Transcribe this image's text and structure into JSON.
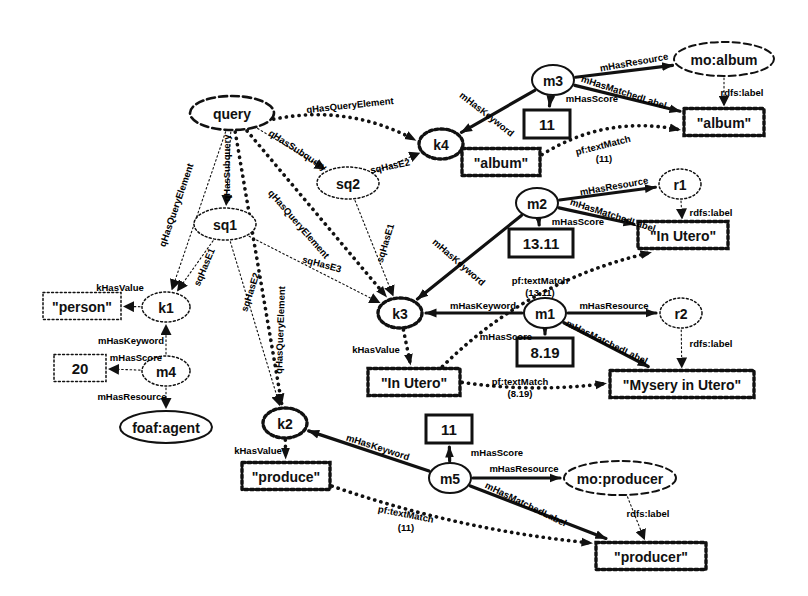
{
  "diagram": {
    "colors": {
      "stroke": "#111111",
      "fill": "#ffffff",
      "text": "#111111"
    },
    "nodes": [
      {
        "id": "query",
        "label": "query",
        "shape": "ellipse-dashed-bold",
        "x": 232,
        "y": 113,
        "rx": 42,
        "ry": 17
      },
      {
        "id": "sq1",
        "label": "sq1",
        "shape": "ellipse-dotted",
        "x": 225,
        "y": 224,
        "rx": 31,
        "ry": 16
      },
      {
        "id": "sq2",
        "label": "sq2",
        "shape": "ellipse-dotted",
        "x": 348,
        "y": 183,
        "rx": 31,
        "ry": 16
      },
      {
        "id": "k1",
        "label": "k1",
        "shape": "ellipse-dotted",
        "x": 166,
        "y": 307,
        "rx": 24,
        "ry": 15
      },
      {
        "id": "k2",
        "label": "k2",
        "shape": "ellipse-dotted-bold",
        "x": 285,
        "y": 423,
        "rx": 22,
        "ry": 15
      },
      {
        "id": "k3",
        "label": "k3",
        "shape": "ellipse-dotted-bold",
        "x": 400,
        "y": 313,
        "rx": 22,
        "ry": 15
      },
      {
        "id": "k4",
        "label": "k4",
        "shape": "ellipse-dotted-bold",
        "x": 441,
        "y": 144,
        "rx": 22,
        "ry": 15
      },
      {
        "id": "m1",
        "label": "m1",
        "shape": "ellipse-solid",
        "x": 545,
        "y": 313,
        "rx": 21,
        "ry": 15
      },
      {
        "id": "m2",
        "label": "m2",
        "shape": "ellipse-solid",
        "x": 537,
        "y": 203,
        "rx": 21,
        "ry": 15
      },
      {
        "id": "m3",
        "label": "m3",
        "shape": "ellipse-solid",
        "x": 553,
        "y": 80,
        "rx": 21,
        "ry": 15
      },
      {
        "id": "m4",
        "label": "m4",
        "shape": "ellipse-dotted",
        "x": 166,
        "y": 371,
        "rx": 24,
        "ry": 15
      },
      {
        "id": "m5",
        "label": "m5",
        "shape": "ellipse-solid",
        "x": 450,
        "y": 478,
        "rx": 21,
        "ry": 15
      },
      {
        "id": "r1",
        "label": "r1",
        "shape": "ellipse-dotted",
        "x": 680,
        "y": 184,
        "rx": 21,
        "ry": 15
      },
      {
        "id": "r2",
        "label": "r2",
        "shape": "ellipse-dotted",
        "x": 681,
        "y": 313,
        "rx": 21,
        "ry": 15
      },
      {
        "id": "mo_album",
        "label": "mo:album",
        "shape": "ellipse-dashed",
        "x": 724,
        "y": 59,
        "rx": 50,
        "ry": 17
      },
      {
        "id": "mo_producer",
        "label": "mo:producer",
        "shape": "ellipse-dashed",
        "x": 620,
        "y": 478,
        "rx": 56,
        "ry": 17
      },
      {
        "id": "foaf_agent",
        "label": "foaf:agent",
        "shape": "ellipse-solid",
        "x": 166,
        "y": 427,
        "rx": 46,
        "ry": 16
      },
      {
        "id": "b_person",
        "label": "\"person\"",
        "shape": "rect-dotted",
        "x": 82,
        "y": 306,
        "w": 78,
        "h": 27
      },
      {
        "id": "b_20",
        "label": "20",
        "shape": "rect-dotted",
        "x": 80,
        "y": 368,
        "w": 52,
        "h": 27
      },
      {
        "id": "b_produce",
        "label": "\"produce\"",
        "shape": "rect-dotted-bold",
        "x": 286,
        "y": 476,
        "w": 88,
        "h": 27
      },
      {
        "id": "b_inutero_k",
        "label": "\"In Utero\"",
        "shape": "rect-dotted-bold",
        "x": 414,
        "y": 382,
        "w": 92,
        "h": 27
      },
      {
        "id": "b_album_k",
        "label": "\"album\"",
        "shape": "rect-dotted-bold",
        "x": 501,
        "y": 162,
        "w": 78,
        "h": 27
      },
      {
        "id": "b_album_r",
        "label": "\"album\"",
        "shape": "rect-dotted-bold",
        "x": 724,
        "y": 122,
        "w": 80,
        "h": 27
      },
      {
        "id": "b_inutero_r",
        "label": "\"In Utero\"",
        "shape": "rect-dotted-bold",
        "x": 683,
        "y": 235,
        "w": 90,
        "h": 27
      },
      {
        "id": "b_mysery",
        "label": "\"Mysery in Utero\"",
        "shape": "rect-dotted-bold",
        "x": 682,
        "y": 384,
        "w": 144,
        "h": 27
      },
      {
        "id": "b_producer",
        "label": "\"producer\"",
        "shape": "rect-dotted-bold",
        "x": 651,
        "y": 556,
        "w": 110,
        "h": 27
      },
      {
        "id": "n_11_m3",
        "label": "11",
        "shape": "rect-solid-bold",
        "x": 547,
        "y": 124,
        "w": 46,
        "h": 28
      },
      {
        "id": "n_1311_m2",
        "label": "13.11",
        "shape": "rect-solid-bold",
        "x": 541,
        "y": 243,
        "w": 64,
        "h": 28
      },
      {
        "id": "n_819_m1",
        "label": "8.19",
        "shape": "rect-solid-bold",
        "x": 545,
        "y": 352,
        "w": 56,
        "h": 28
      },
      {
        "id": "n_11_m5",
        "label": "11",
        "shape": "rect-solid-bold",
        "x": 449,
        "y": 429,
        "w": 46,
        "h": 28
      }
    ],
    "edges": [
      {
        "from": "query",
        "to": "k4",
        "label": "qHasQueryElement",
        "style": "dotted-bold"
      },
      {
        "from": "query",
        "to": "k1",
        "label": "qHasQueryElement",
        "style": "dotted-thin"
      },
      {
        "from": "query",
        "to": "sq1",
        "label": "qHasSubquery",
        "style": "dotted-thin"
      },
      {
        "from": "query",
        "to": "k3",
        "label": "qHasQueryElement",
        "style": "dotted-bold"
      },
      {
        "from": "query",
        "to": "k2",
        "label": "qHasQueryElement",
        "style": "dotted-bold"
      },
      {
        "from": "query",
        "to": "sq2",
        "label": "qHasSubquery",
        "style": "dotted-thin"
      },
      {
        "from": "sq2",
        "to": "k4",
        "label": "sqHasE2",
        "style": "dotted-thin"
      },
      {
        "from": "sq2",
        "to": "k3",
        "label": "sqHasE1",
        "style": "dotted-thin"
      },
      {
        "from": "sq1",
        "to": "k1",
        "label": "sqHasE1",
        "style": "dotted-thin"
      },
      {
        "from": "sq1",
        "to": "k2",
        "label": "sqHasE2",
        "style": "dotted-thin"
      },
      {
        "from": "sq1",
        "to": "k3",
        "label": "sqHasE3",
        "style": "dotted-thin"
      },
      {
        "from": "k1",
        "to": "b_person",
        "label": "kHasValue",
        "style": "dotted-thin"
      },
      {
        "from": "k2",
        "to": "b_produce",
        "label": "kHasValue",
        "style": "dotted-bold"
      },
      {
        "from": "k3",
        "to": "b_inutero_k",
        "label": "kHasValue",
        "style": "dotted-bold"
      },
      {
        "from": "k4",
        "to": "b_album_k",
        "label": "kHasValue",
        "style": "dotted-bold"
      },
      {
        "from": "m4",
        "to": "k1",
        "label": "mHasKeyword",
        "style": "dotted-thin"
      },
      {
        "from": "m4",
        "to": "b_20",
        "label": "mHasScore",
        "style": "dotted-thin"
      },
      {
        "from": "m4",
        "to": "foaf_agent",
        "label": "mHasResource",
        "style": "dotted-thin"
      },
      {
        "from": "m3",
        "to": "k4",
        "label": "mHasKeyword",
        "style": "solid-bold"
      },
      {
        "from": "m3",
        "to": "n_11_m3",
        "label": "mHasScore",
        "style": "solid-bold"
      },
      {
        "from": "m3",
        "to": "mo_album",
        "label": "mHasResource",
        "style": "solid-bold"
      },
      {
        "from": "m3",
        "to": "b_album_r",
        "label": "mHasMatchedLabel",
        "style": "solid-bold"
      },
      {
        "from": "mo_album",
        "to": "b_album_r",
        "label": "rdfs:label",
        "style": "dotted-thin"
      },
      {
        "from": "b_album_k",
        "to": "b_album_r",
        "label": "pf:textMatch (11)",
        "style": "dotted-bold"
      },
      {
        "from": "m2",
        "to": "k3",
        "label": "mHasKeyword",
        "style": "solid-bold"
      },
      {
        "from": "m2",
        "to": "n_1311_m2",
        "label": "mHasScore",
        "style": "solid-bold"
      },
      {
        "from": "m2",
        "to": "r1",
        "label": "mHasResource",
        "style": "solid-bold"
      },
      {
        "from": "m2",
        "to": "b_inutero_r",
        "label": "mHasMatchedLabel",
        "style": "solid-bold"
      },
      {
        "from": "r1",
        "to": "b_inutero_r",
        "label": "rdfs:label",
        "style": "dotted-thin"
      },
      {
        "from": "b_inutero_k",
        "to": "b_inutero_r",
        "label": "pf:textMatch (13.11)",
        "style": "dotted-bold"
      },
      {
        "from": "m1",
        "to": "k3",
        "label": "mHasKeyword",
        "style": "solid-bold"
      },
      {
        "from": "m1",
        "to": "n_819_m1",
        "label": "mHasScore",
        "style": "solid-bold"
      },
      {
        "from": "m1",
        "to": "r2",
        "label": "mHasResource",
        "style": "solid-bold"
      },
      {
        "from": "m1",
        "to": "b_mysery",
        "label": "mHasMatchedLabel",
        "style": "solid-bold"
      },
      {
        "from": "r2",
        "to": "b_mysery",
        "label": "rdfs:label",
        "style": "dotted-thin"
      },
      {
        "from": "b_inutero_k",
        "to": "b_mysery",
        "label": "pf:textMatch (8.19)",
        "style": "dotted-bold"
      },
      {
        "from": "m5",
        "to": "k2",
        "label": "mHasKeyword",
        "style": "solid-bold"
      },
      {
        "from": "m5",
        "to": "n_11_m5",
        "label": "mHasScore",
        "style": "solid-bold"
      },
      {
        "from": "m5",
        "to": "mo_producer",
        "label": "mHasResource",
        "style": "solid-bold"
      },
      {
        "from": "m5",
        "to": "b_producer",
        "label": "mHasMatchedLabel",
        "style": "solid-bold"
      },
      {
        "from": "mo_producer",
        "to": "b_producer",
        "label": "rdfs:label",
        "style": "dotted-thin"
      },
      {
        "from": "b_produce",
        "to": "b_producer",
        "label": "pf:textMatch (11)",
        "style": "dotted-bold"
      }
    ],
    "edge_labels": [
      {
        "id": "el_q_k4",
        "text": "qHasQueryElement",
        "x": 350,
        "y": 105,
        "rot": -6,
        "size": 10
      },
      {
        "id": "el_q_k1",
        "text": "qHasQueryElement",
        "x": 176,
        "y": 205,
        "rot": -71,
        "size": 9
      },
      {
        "id": "el_q_sq1",
        "text": "qHasSubquery",
        "x": 226,
        "y": 168,
        "rot": -90,
        "size": 9
      },
      {
        "id": "el_q_k3",
        "text": "qHasQueryElement",
        "x": 299,
        "y": 224,
        "rot": 49,
        "size": 10
      },
      {
        "id": "el_q_k2",
        "text": "qHasQueryElement",
        "x": 280,
        "y": 330,
        "rot": -88,
        "size": 9
      },
      {
        "id": "el_q_sq2",
        "text": "qHasSubquery",
        "x": 298,
        "y": 150,
        "rot": 33,
        "size": 9.5
      },
      {
        "id": "el_sq2_k4",
        "text": "sqHasE2",
        "x": 390,
        "y": 166,
        "rot": -12,
        "size": 9
      },
      {
        "id": "el_sq2_k3",
        "text": "sqHasE1",
        "x": 385,
        "y": 243,
        "rot": -73,
        "size": 8.5
      },
      {
        "id": "el_sq1_k1",
        "text": "sqHasE1",
        "x": 204,
        "y": 267,
        "rot": -67,
        "size": 8.5
      },
      {
        "id": "el_sq1_k2",
        "text": "sqHasE2",
        "x": 250,
        "y": 292,
        "rot": -72,
        "size": 8.5
      },
      {
        "id": "el_sq1_k3",
        "text": "sqHasE3",
        "x": 322,
        "y": 264,
        "rot": 15,
        "size": 9
      },
      {
        "id": "el_k1_v",
        "text": "kHasValue",
        "x": 120,
        "y": 287,
        "rot": 0,
        "size": 9.5
      },
      {
        "id": "el_k2_v",
        "text": "kHasValue",
        "x": 258,
        "y": 450,
        "rot": 0,
        "size": 9.5
      },
      {
        "id": "el_k3_v",
        "text": "kHasValue",
        "x": 376,
        "y": 349,
        "rot": 0,
        "size": 9.5
      },
      {
        "id": "el_m4_k1",
        "text": "mHasKeyword",
        "x": 131,
        "y": 340,
        "rot": 0,
        "size": 9.5
      },
      {
        "id": "el_m4_s",
        "text": "mHasScore",
        "x": 136,
        "y": 357,
        "rot": 0,
        "size": 9.5
      },
      {
        "id": "el_m4_r",
        "text": "mHasResource",
        "x": 132,
        "y": 396,
        "rot": 0,
        "size": 9.5
      },
      {
        "id": "el_m3_k",
        "text": "mHasKeyword",
        "x": 487,
        "y": 114,
        "rot": 38,
        "size": 9.5
      },
      {
        "id": "el_m3_s",
        "text": "mHasScore",
        "x": 592,
        "y": 98,
        "rot": 0,
        "size": 9.5
      },
      {
        "id": "el_m3_r",
        "text": "mHasResource",
        "x": 634,
        "y": 62,
        "rot": -10,
        "size": 9.5
      },
      {
        "id": "el_m3_ml",
        "text": "mHasMatchedLabel",
        "x": 624,
        "y": 92,
        "rot": 18,
        "size": 9.5
      },
      {
        "id": "el_rdfs1",
        "text": "rdfs:label",
        "x": 742,
        "y": 92,
        "rot": 0,
        "size": 9.5
      },
      {
        "id": "el_pf1",
        "text": "pf:textMatch",
        "x": 603,
        "y": 145,
        "rot": -14,
        "size": 9
      },
      {
        "id": "el_pf1b",
        "text": "(11)",
        "x": 604,
        "y": 158,
        "rot": 0,
        "size": 9
      },
      {
        "id": "el_m2_k",
        "text": "mHasKeyword",
        "x": 459,
        "y": 262,
        "rot": 41,
        "size": 9.5
      },
      {
        "id": "el_m2_s",
        "text": "mHasScore",
        "x": 578,
        "y": 221,
        "rot": 0,
        "size": 9.5
      },
      {
        "id": "el_m2_r",
        "text": "mHasResource",
        "x": 614,
        "y": 186,
        "rot": -10,
        "size": 9.5
      },
      {
        "id": "el_m2_ml",
        "text": "mHasMatchedLabel",
        "x": 613,
        "y": 215,
        "rot": 18,
        "size": 9.5
      },
      {
        "id": "el_rdfs2",
        "text": "rdfs:label",
        "x": 711,
        "y": 212,
        "rot": 0,
        "size": 9.5
      },
      {
        "id": "el_pf2",
        "text": "pf:textMatch",
        "x": 540,
        "y": 280,
        "rot": 0,
        "size": 9
      },
      {
        "id": "el_pf2b",
        "text": "(13.11)",
        "x": 540,
        "y": 292,
        "rot": 0,
        "size": 9
      },
      {
        "id": "el_m1_k",
        "text": "mHasKeyword",
        "x": 483,
        "y": 305,
        "rot": 0,
        "size": 9.5
      },
      {
        "id": "el_m1_s",
        "text": "mHasScore",
        "x": 506,
        "y": 336,
        "rot": 0,
        "size": 9.5
      },
      {
        "id": "el_m1_r",
        "text": "mHasResource",
        "x": 614,
        "y": 305,
        "rot": 0,
        "size": 9.5
      },
      {
        "id": "el_m1_ml",
        "text": "mHasMatchedLabel",
        "x": 607,
        "y": 342,
        "rot": 26,
        "size": 9.5
      },
      {
        "id": "el_rdfs3",
        "text": "rdfs:label",
        "x": 711,
        "y": 343,
        "rot": 0,
        "size": 9.5
      },
      {
        "id": "el_pf3",
        "text": "pf:textMatch",
        "x": 520,
        "y": 381,
        "rot": 0,
        "size": 9
      },
      {
        "id": "el_pf3b",
        "text": "(8.19)",
        "x": 520,
        "y": 393,
        "rot": 0,
        "size": 9
      },
      {
        "id": "el_m5_k",
        "text": "mHasKeyword",
        "x": 378,
        "y": 447,
        "rot": 18,
        "size": 9.5
      },
      {
        "id": "el_m5_s",
        "text": "mHasScore",
        "x": 497,
        "y": 452,
        "rot": 0,
        "size": 9.5
      },
      {
        "id": "el_m5_r",
        "text": "mHasResource",
        "x": 524,
        "y": 468,
        "rot": 0,
        "size": 9.5
      },
      {
        "id": "el_m5_ml",
        "text": "mHasMatchedLabel",
        "x": 526,
        "y": 504,
        "rot": 26,
        "size": 9.5
      },
      {
        "id": "el_rdfs4",
        "text": "rdfs:label",
        "x": 648,
        "y": 513,
        "rot": 0,
        "size": 9.5
      },
      {
        "id": "el_pf4",
        "text": "pf:textMatch",
        "x": 406,
        "y": 514,
        "rot": 11,
        "size": 9
      },
      {
        "id": "el_pf4b",
        "text": "(11)",
        "x": 406,
        "y": 527,
        "rot": 0,
        "size": 9
      }
    ]
  }
}
